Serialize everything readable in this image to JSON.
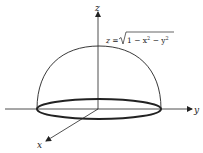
{
  "figure": {
    "type": "3D hemisphere diagram",
    "surface_equation": "z = √1 − x² − y²",
    "equation_parts": {
      "lhs": "z = ",
      "radicand": "1 − x",
      "exp1": "2",
      "mid": " − y",
      "exp2": "2"
    },
    "axes": {
      "x_label": "x",
      "y_label": "y",
      "z_label": "z"
    },
    "colors": {
      "line": "#222222",
      "background": "#ffffff"
    }
  }
}
